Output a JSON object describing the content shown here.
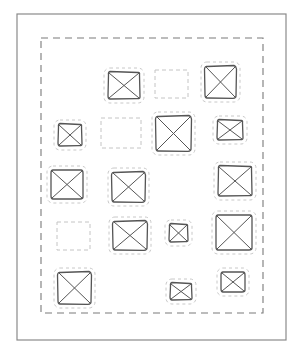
{
  "diagram": {
    "type": "wireframe-sketch",
    "colors": {
      "background": "#ffffff",
      "frame": "#8a8a8a",
      "container_dash": "#7a7a7a",
      "placeholder_stroke": "#555555",
      "halo_dash": "#c8c8c8",
      "empty_dash": "#c4c4c4"
    },
    "outer_frame": {
      "x": 17,
      "y": 14,
      "w": 269,
      "h": 326
    },
    "container": {
      "x": 41,
      "y": 38,
      "w": 222,
      "h": 275
    },
    "elements": [
      {
        "kind": "image-placeholder",
        "x": 108,
        "y": 72,
        "w": 32,
        "h": 27
      },
      {
        "kind": "empty-placeholder",
        "x": 155,
        "y": 70,
        "w": 33,
        "h": 28
      },
      {
        "kind": "image-placeholder",
        "x": 205,
        "y": 66,
        "w": 31,
        "h": 32
      },
      {
        "kind": "image-placeholder",
        "x": 58,
        "y": 124,
        "w": 24,
        "h": 22
      },
      {
        "kind": "empty-placeholder",
        "x": 101,
        "y": 118,
        "w": 40,
        "h": 30
      },
      {
        "kind": "image-placeholder",
        "x": 156,
        "y": 116,
        "w": 35,
        "h": 35
      },
      {
        "kind": "image-placeholder",
        "x": 217,
        "y": 120,
        "w": 26,
        "h": 20
      },
      {
        "kind": "image-placeholder",
        "x": 51,
        "y": 170,
        "w": 32,
        "h": 29
      },
      {
        "kind": "image-placeholder",
        "x": 112,
        "y": 172,
        "w": 33,
        "h": 30
      },
      {
        "kind": "image-placeholder",
        "x": 218,
        "y": 166,
        "w": 34,
        "h": 30
      },
      {
        "kind": "empty-placeholder",
        "x": 57,
        "y": 222,
        "w": 33,
        "h": 28
      },
      {
        "kind": "image-placeholder",
        "x": 113,
        "y": 221,
        "w": 34,
        "h": 29
      },
      {
        "kind": "image-placeholder",
        "x": 169,
        "y": 224,
        "w": 19,
        "h": 18
      },
      {
        "kind": "image-placeholder",
        "x": 216,
        "y": 215,
        "w": 36,
        "h": 35
      },
      {
        "kind": "image-placeholder",
        "x": 58,
        "y": 272,
        "w": 33,
        "h": 32
      },
      {
        "kind": "image-placeholder",
        "x": 170,
        "y": 283,
        "w": 22,
        "h": 17
      },
      {
        "kind": "image-placeholder",
        "x": 221,
        "y": 272,
        "w": 24,
        "h": 20
      }
    ]
  }
}
